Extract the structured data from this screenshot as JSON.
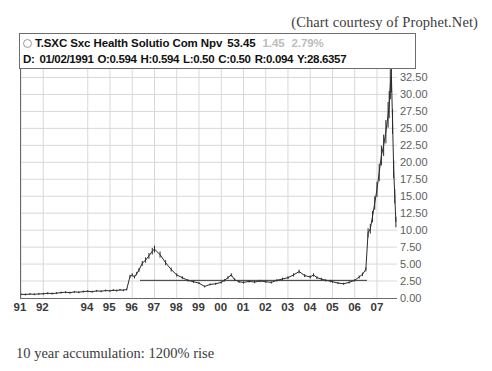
{
  "courtesy": "(Chart courtesy of Prophet.Net)",
  "caption": "10 year accumulation: 1200% rise",
  "quote": {
    "status_icon": "circle-indicator-icon",
    "symbol": "T.SXC",
    "name": "Sxc Health Solutio Com Npv",
    "symbol_and_name": "T.SXC Sxc Health Solutio Com Npv",
    "last": "53.45",
    "change": "1.45",
    "change_pct": "2.79%",
    "change_color": "#bcbcbc",
    "ohlc": {
      "date_label": "D:",
      "date": "01/02/1991",
      "open": "O:0.594",
      "high": "H:0.594",
      "low": "L:0.50",
      "close": "C:0.50",
      "range": "R:0.094",
      "yield": "Y:28.6357",
      "full_line": "D: 01/02/1991 O:0.594 H:0.594 L:0.50 C:0.50 R:0.094 Y:28.6357"
    }
  },
  "chart_data": {
    "type": "line",
    "title": "T.SXC Sxc Health Solutio Com Npv",
    "xlabel": "",
    "ylabel": "",
    "ylim": [
      0,
      33.75
    ],
    "grid": true,
    "legend": null,
    "y_ticks": [
      "32.50",
      "30.00",
      "27.50",
      "25.00",
      "22.50",
      "20.00",
      "17.50",
      "15.00",
      "12.50",
      "10.00",
      "7.50",
      "5.00",
      "2.50",
      "0.00"
    ],
    "y_tick_values": [
      32.5,
      30.0,
      27.5,
      25.0,
      22.5,
      20.0,
      17.5,
      15.0,
      12.5,
      10.0,
      7.5,
      5.0,
      2.5,
      0.0
    ],
    "x_ticks": [
      "91",
      "92",
      "94",
      "95",
      "96",
      "97",
      "98",
      "99",
      "00",
      "01",
      "02",
      "03",
      "04",
      "05",
      "06",
      "07"
    ],
    "x_tick_years": [
      1991,
      1992,
      1994,
      1995,
      1996,
      1997,
      1998,
      1999,
      2000,
      2001,
      2002,
      2003,
      2004,
      2005,
      2006,
      2007
    ],
    "x_range": [
      1991.0,
      2007.9
    ],
    "trendline": {
      "label": "support-trendline",
      "y": 2.6,
      "x_start": 1996.35,
      "x_end": 2006.55
    },
    "series": [
      {
        "name": "T.SXC price",
        "style": "ohlc-bars",
        "x": [
          1991.0,
          1991.2,
          1991.4,
          1991.6,
          1991.8,
          1992.0,
          1992.2,
          1992.4,
          1992.6,
          1992.8,
          1993.0,
          1993.2,
          1993.4,
          1993.6,
          1993.8,
          1994.0,
          1994.2,
          1994.4,
          1994.6,
          1994.8,
          1995.0,
          1995.15,
          1995.3,
          1995.45,
          1995.6,
          1995.75,
          1995.9,
          1996.0,
          1996.1,
          1996.2,
          1996.3,
          1996.45,
          1996.6,
          1996.75,
          1996.9,
          1997.0,
          1997.25,
          1997.5,
          1997.75,
          1998.0,
          1998.25,
          1998.5,
          1998.75,
          1999.0,
          1999.25,
          1999.5,
          1999.75,
          2000.0,
          2000.15,
          2000.3,
          2000.45,
          2000.6,
          2000.8,
          2001.0,
          2001.25,
          2001.5,
          2001.75,
          2002.0,
          2002.25,
          2002.5,
          2002.75,
          2003.0,
          2003.25,
          2003.5,
          2003.75,
          2004.0,
          2004.15,
          2004.3,
          2004.5,
          2004.7,
          2004.9,
          2005.0,
          2005.25,
          2005.5,
          2005.75,
          2006.0,
          2006.2,
          2006.35,
          2006.5,
          2006.6,
          2006.7,
          2006.8,
          2006.9,
          2007.0,
          2007.1,
          2007.2,
          2007.3,
          2007.4,
          2007.5,
          2007.55,
          2007.6,
          2007.65,
          2007.7,
          2007.75,
          2007.8,
          2007.85
        ],
        "y": [
          0.55,
          0.52,
          0.58,
          0.55,
          0.6,
          0.62,
          0.7,
          0.65,
          0.72,
          0.8,
          0.85,
          0.78,
          0.9,
          0.85,
          0.95,
          1.0,
          0.92,
          1.05,
          1.0,
          1.1,
          1.05,
          1.15,
          1.1,
          1.2,
          1.15,
          1.25,
          3.2,
          3.4,
          3.1,
          3.6,
          4.1,
          5.1,
          5.6,
          6.2,
          6.9,
          7.2,
          6.4,
          5.2,
          4.2,
          3.4,
          3.0,
          2.6,
          2.4,
          2.2,
          1.7,
          2.0,
          2.1,
          2.3,
          2.6,
          3.0,
          3.4,
          2.7,
          2.4,
          2.3,
          2.45,
          2.35,
          2.5,
          2.4,
          2.3,
          2.6,
          2.8,
          3.0,
          3.4,
          3.9,
          3.3,
          3.1,
          3.4,
          3.0,
          2.8,
          2.6,
          2.5,
          2.4,
          2.2,
          2.1,
          2.3,
          2.6,
          3.1,
          3.5,
          4.2,
          9.6,
          10.2,
          12.0,
          14.0,
          16.0,
          18.5,
          21.0,
          22.5,
          24.5,
          27.0,
          28.5,
          31.5,
          32.6,
          26.0,
          19.0,
          15.0,
          11.2
        ]
      }
    ],
    "annotations": [
      {
        "text": "10 year accumulation: 1200% rise",
        "position": "below-chart"
      },
      {
        "text": "(Chart courtesy of Prophet.Net)",
        "position": "above-chart-right"
      }
    ]
  }
}
